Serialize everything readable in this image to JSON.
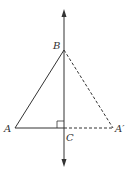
{
  "diagram": {
    "type": "geometry-reflection",
    "labels": {
      "B": "B",
      "A": "A",
      "A_prime": "A′",
      "C": "C"
    },
    "points": {
      "A": [
        15,
        128
      ],
      "B": [
        64,
        50
      ],
      "C": [
        64,
        128
      ],
      "A_prime": [
        113,
        128
      ]
    },
    "axis": {
      "x": 64,
      "y_top": 10,
      "y_bottom": 166
    },
    "colors": {
      "line": "#333333",
      "background": "#ffffff"
    }
  }
}
